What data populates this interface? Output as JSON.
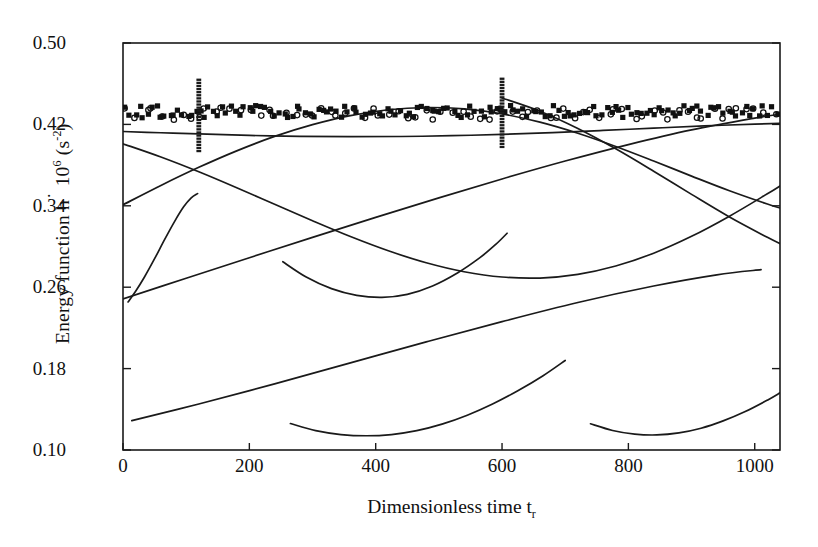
{
  "figure": {
    "background": "#ffffff",
    "ink": "#1a1a1a"
  },
  "axes": {
    "y_title_prefix": "Energy function h",
    "y_title_dot": "˙",
    "y_title_mid": " 10",
    "y_title_exp": "6",
    "y_title_unit_open": " (s",
    "y_title_unit_exp": "-2",
    "y_title_unit_close": ")",
    "x_title_main": "Dimensionless time t",
    "x_title_sub": "r"
  },
  "chart_data": {
    "type": "line",
    "title": "",
    "xlabel": "Dimensionless time t_r",
    "ylabel": "Energy function h˙ 10^6 (s^-2)",
    "xlim": [
      0,
      1040
    ],
    "ylim": [
      0.1,
      0.5
    ],
    "xticks": [
      0,
      200,
      400,
      600,
      800,
      1000
    ],
    "xtick_labels": [
      "0",
      "200",
      "400",
      "600",
      "800",
      "1000"
    ],
    "yticks": [
      0.1,
      0.18,
      0.26,
      0.34,
      0.42,
      0.5
    ],
    "ytick_labels": [
      "0.10",
      "0.18",
      "0.26",
      "0.34",
      "0.42",
      "0.50"
    ],
    "grid": false,
    "legend": "none",
    "frame": "box",
    "series": [
      {
        "name": "upper-envelope-curve",
        "kind": "line",
        "points": [
          [
            0,
            0.413
          ],
          [
            60,
            0.4118
          ],
          [
            120,
            0.4106
          ],
          [
            200,
            0.4092
          ],
          [
            280,
            0.4083
          ],
          [
            360,
            0.4079
          ],
          [
            440,
            0.4081
          ],
          [
            520,
            0.4089
          ],
          [
            600,
            0.4102
          ],
          [
            680,
            0.412
          ],
          [
            760,
            0.4141
          ],
          [
            840,
            0.4163
          ],
          [
            920,
            0.4185
          ],
          [
            1000,
            0.4203
          ],
          [
            1040,
            0.421
          ]
        ]
      },
      {
        "name": "sinusoid-A-rising-from-0.34",
        "kind": "line",
        "points": [
          [
            0,
            0.341
          ],
          [
            60,
            0.36
          ],
          [
            120,
            0.3778
          ],
          [
            180,
            0.394
          ],
          [
            240,
            0.4082
          ],
          [
            300,
            0.4198
          ],
          [
            360,
            0.4287
          ],
          [
            420,
            0.4344
          ],
          [
            480,
            0.4366
          ],
          [
            540,
            0.4352
          ],
          [
            600,
            0.4303
          ],
          [
            660,
            0.4222
          ],
          [
            720,
            0.4113
          ],
          [
            780,
            0.3983
          ],
          [
            840,
            0.384
          ],
          [
            900,
            0.3692
          ],
          [
            960,
            0.3548
          ],
          [
            1020,
            0.3417
          ],
          [
            1040,
            0.3378
          ]
        ]
      },
      {
        "name": "sinusoid-B-descending-from-0.40",
        "kind": "line",
        "points": [
          [
            0,
            0.401
          ],
          [
            60,
            0.388
          ],
          [
            120,
            0.3735
          ],
          [
            180,
            0.3578
          ],
          [
            240,
            0.3415
          ],
          [
            300,
            0.3253
          ],
          [
            360,
            0.3098
          ],
          [
            420,
            0.2958
          ],
          [
            480,
            0.284
          ],
          [
            540,
            0.2752
          ],
          [
            600,
            0.27
          ],
          [
            660,
            0.269
          ],
          [
            720,
            0.2726
          ],
          [
            780,
            0.2808
          ],
          [
            840,
            0.2934
          ],
          [
            900,
            0.31
          ],
          [
            960,
            0.3298
          ],
          [
            1020,
            0.3518
          ],
          [
            1040,
            0.3595
          ]
        ]
      },
      {
        "name": "steep-riser-short-arc-left",
        "kind": "line",
        "points": [
          [
            8,
            0.2455
          ],
          [
            20,
            0.256
          ],
          [
            34,
            0.27
          ],
          [
            50,
            0.288
          ],
          [
            66,
            0.307
          ],
          [
            82,
            0.325
          ],
          [
            96,
            0.339
          ],
          [
            108,
            0.3478
          ],
          [
            118,
            0.352
          ]
        ]
      },
      {
        "name": "U-curve-mid-upper",
        "kind": "line",
        "points": [
          [
            253,
            0.285
          ],
          [
            290,
            0.27
          ],
          [
            330,
            0.2586
          ],
          [
            370,
            0.252
          ],
          [
            410,
            0.25
          ],
          [
            450,
            0.253
          ],
          [
            490,
            0.2612
          ],
          [
            530,
            0.2742
          ],
          [
            565,
            0.289
          ],
          [
            590,
            0.302
          ],
          [
            608,
            0.313
          ]
        ]
      },
      {
        "name": "long-rising-line-lower",
        "kind": "line",
        "points": [
          [
            0,
            0.2485
          ],
          [
            100,
            0.2688
          ],
          [
            200,
            0.289
          ],
          [
            300,
            0.309
          ],
          [
            400,
            0.3286
          ],
          [
            500,
            0.3478
          ],
          [
            600,
            0.3664
          ],
          [
            700,
            0.384
          ],
          [
            800,
            0.4002
          ],
          [
            900,
            0.4146
          ],
          [
            1000,
            0.4262
          ],
          [
            1040,
            0.43
          ]
        ]
      },
      {
        "name": "long-rising-line-bottom",
        "kind": "line",
        "points": [
          [
            14,
            0.1288
          ],
          [
            120,
            0.1452
          ],
          [
            240,
            0.165
          ],
          [
            360,
            0.1856
          ],
          [
            480,
            0.2062
          ],
          [
            600,
            0.2262
          ],
          [
            720,
            0.245
          ],
          [
            840,
            0.2612
          ],
          [
            940,
            0.2722
          ],
          [
            1010,
            0.2772
          ]
        ]
      },
      {
        "name": "U-curve-bottom-left",
        "kind": "line",
        "points": [
          [
            265,
            0.126
          ],
          [
            305,
            0.119
          ],
          [
            345,
            0.1152
          ],
          [
            385,
            0.114
          ],
          [
            425,
            0.1152
          ],
          [
            465,
            0.119
          ],
          [
            505,
            0.1254
          ],
          [
            545,
            0.1342
          ],
          [
            585,
            0.1452
          ],
          [
            625,
            0.1582
          ],
          [
            665,
            0.173
          ],
          [
            700,
            0.188
          ]
        ]
      },
      {
        "name": "U-curve-bottom-right",
        "kind": "line",
        "points": [
          [
            740,
            0.1258
          ],
          [
            775,
            0.1192
          ],
          [
            810,
            0.1156
          ],
          [
            845,
            0.1148
          ],
          [
            880,
            0.1168
          ],
          [
            915,
            0.1214
          ],
          [
            950,
            0.1286
          ],
          [
            985,
            0.1378
          ],
          [
            1020,
            0.149
          ],
          [
            1040,
            0.1562
          ]
        ]
      },
      {
        "name": "descending-tail-right",
        "kind": "line",
        "points": [
          [
            600,
            0.446
          ],
          [
            660,
            0.433
          ],
          [
            720,
            0.416
          ],
          [
            780,
            0.396
          ],
          [
            840,
            0.374
          ],
          [
            900,
            0.3512
          ],
          [
            960,
            0.329
          ],
          [
            1020,
            0.309
          ],
          [
            1040,
            0.3028
          ]
        ]
      }
    ],
    "scatter_series": [
      {
        "name": "measured-data-filled-squares",
        "marker": "filled-square",
        "color": "#111111",
        "approx_level": 0.4325,
        "jitter": 0.006,
        "count": 150,
        "x_range": [
          2,
          1038
        ]
      },
      {
        "name": "measured-data-open-circles",
        "marker": "open-circle",
        "color": "#111111",
        "approx_level": 0.4305,
        "jitter": 0.006,
        "count": 75,
        "x_range": [
          2,
          1038
        ]
      }
    ],
    "spikes": [
      {
        "name": "vertical-marker-spike-left",
        "x": 120,
        "y_min": 0.393,
        "y_max": 0.465
      },
      {
        "name": "vertical-marker-spike-right",
        "x": 600,
        "y_min": 0.398,
        "y_max": 0.466
      }
    ],
    "annotations": []
  }
}
